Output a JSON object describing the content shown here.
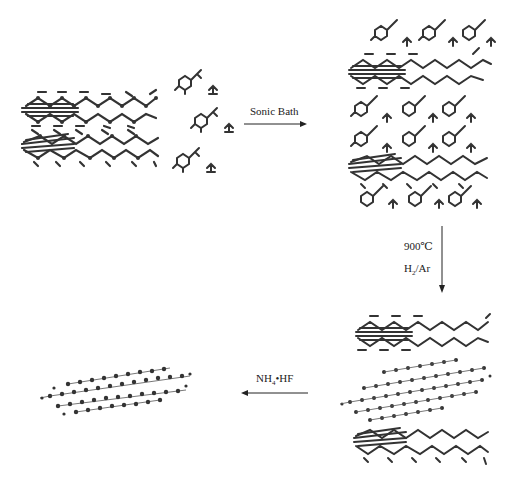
{
  "diagram": {
    "steps": [
      {
        "id": "step1",
        "reagent": "Sonic Bath",
        "direction": "right"
      },
      {
        "id": "step2",
        "reagent_line1": "900℃",
        "reagent_line2_main": "H",
        "reagent_line2_sub": "2",
        "reagent_line2_rest": "/Ar",
        "direction": "down"
      },
      {
        "id": "step3",
        "reagent_main": "NH",
        "reagent_sub": "4",
        "reagent_rest": "•HF",
        "direction": "left"
      }
    ],
    "structures": [
      {
        "id": "layered-precursor",
        "description": "Two stacked molecular layers (graphite-like)"
      },
      {
        "id": "intercalant-molecules",
        "description": "Small intercalant molecules (3 pairs)"
      },
      {
        "id": "intercalated-compound",
        "description": "Layers with intercalated molecules between them"
      },
      {
        "id": "expanded-stack",
        "description": "Stack with graphene sheet between two molecular layers"
      },
      {
        "id": "graphene-sheet",
        "description": "Isolated graphene sheet"
      }
    ],
    "colors": {
      "atoms": "#333333",
      "arrows": "#222222",
      "background": "#ffffff"
    }
  }
}
